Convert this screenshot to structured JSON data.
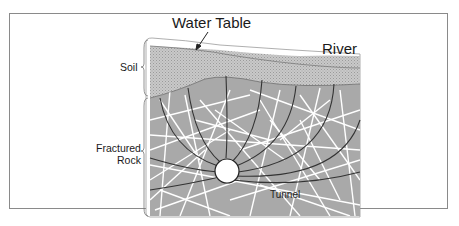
{
  "diagram": {
    "type": "geologic cross-section",
    "labels": {
      "water_table": "Water Table",
      "river": "River",
      "soil": "Soil",
      "fractured_rock_line1": "Fractured",
      "fractured_rock_line2": "Rock",
      "tunnel": "Tunnel"
    },
    "colors": {
      "frame": "#8a8a8a",
      "soil_fill": "#c4c4c4",
      "rock_fill": "#a9a9a9",
      "fracture_lines": "#ffffff",
      "flow_lines": "#333333",
      "tunnel_fill": "#ffffff"
    },
    "layers": [
      "Soil",
      "Fractured Rock"
    ],
    "features": [
      "Water Table",
      "River",
      "Tunnel",
      "Groundwater flow lines converging on tunnel"
    ]
  }
}
